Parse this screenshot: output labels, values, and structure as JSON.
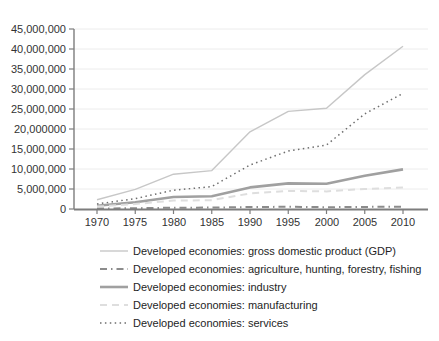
{
  "chart_data": {
    "type": "line",
    "title": "",
    "xlabel": "",
    "ylabel": "",
    "x_labels": [
      "1970",
      "1975",
      "1980",
      "1985",
      "1990",
      "1995",
      "2000",
      "2005",
      "2010"
    ],
    "x_values": [
      1970,
      1975,
      1980,
      1985,
      1990,
      1995,
      2000,
      2005,
      2010
    ],
    "y_tick_labels": [
      "45,000,000",
      "40,000,000",
      "35,000,000",
      "30,000,000",
      "25,000,000",
      "20,000000",
      "15,000,000",
      "10,000,000",
      "5,000,000",
      "0"
    ],
    "ylim": [
      0,
      45000000
    ],
    "y_tick_step": 5000000,
    "grid": "horizontal",
    "legend_position": "bottom-left",
    "axis_color": "#7d7d7d",
    "gridline_color": "#ececec",
    "series": [
      {
        "id": "gdp",
        "label": "Developed economies: gross domestic product (GDP)",
        "color": "#c7c7c7",
        "style": "solid",
        "dash": "",
        "width": 1.4,
        "values": [
          2300000,
          4900000,
          8700000,
          9600000,
          19300000,
          24400000,
          25200000,
          33600000,
          40700000
        ]
      },
      {
        "id": "agriculture",
        "label": "Developed economies: agriculture, hunting, forestry, fishing",
        "color": "#8c8c8c",
        "style": "dash-dot",
        "dash": "7 4 1.5 4",
        "width": 2,
        "values": [
          90000,
          200000,
          320000,
          340000,
          500000,
          540000,
          460000,
          530000,
          580000
        ]
      },
      {
        "id": "industry",
        "label": "Developed economies: industry",
        "color": "#a0a0a0",
        "style": "solid",
        "dash": "",
        "width": 2.6,
        "values": [
          800000,
          1700000,
          3000000,
          3200000,
          5400000,
          6400000,
          6300000,
          8300000,
          9900000
        ]
      },
      {
        "id": "manufacturing",
        "label": "Developed economies: manufacturing",
        "color": "#dedede",
        "style": "dashed",
        "dash": "7 5",
        "width": 2,
        "values": [
          600000,
          1250000,
          2100000,
          2200000,
          3900000,
          4500000,
          4400000,
          5000000,
          5400000
        ]
      },
      {
        "id": "services",
        "label": "Developed economies: services",
        "color": "#6e6e6e",
        "style": "dotted",
        "dash": "1.5 3.4",
        "width": 1.5,
        "values": [
          1250000,
          2600000,
          4700000,
          5600000,
          11000000,
          14500000,
          16000000,
          23800000,
          28900000
        ]
      }
    ]
  }
}
